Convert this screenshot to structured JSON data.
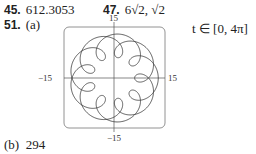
{
  "answers": {
    "a45": {
      "number": "45.",
      "value": "612.3053"
    },
    "a47": {
      "number": "47.",
      "value": "6√2, √2"
    },
    "a51": {
      "number": "51.",
      "part": "(a)",
      "param_range": "t ∈ [0, 4π]"
    },
    "b": {
      "part": "(b)",
      "value": "294"
    }
  },
  "chart_data": {
    "type": "line",
    "title": "",
    "xlabel": "",
    "ylabel": "",
    "xlim": [
      -15,
      15
    ],
    "ylim": [
      -15,
      15
    ],
    "ticks": {
      "top": "15",
      "bottom": "−15",
      "left": "−15",
      "right": "15"
    },
    "param_range": [
      0,
      12.566
    ],
    "curve": "parametric: x = 11cos t − 4cos(11t/2), y = 11sin t − 4sin(11t/2)",
    "grid": false,
    "legend": null
  }
}
